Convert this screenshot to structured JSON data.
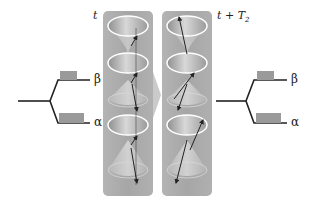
{
  "diagram": {
    "labels": {
      "time_start": "t",
      "time_end_main": "t + T",
      "time_end_sub": "2"
    },
    "energy_levels": {
      "left": {
        "upper": "β",
        "lower": "α"
      },
      "right": {
        "upper": "β",
        "lower": "α"
      }
    },
    "panels": [
      {
        "id": "panel-t",
        "cones": [
          "open-top",
          "open-top",
          "cone-down",
          "open-top",
          "cone-down"
        ]
      },
      {
        "id": "panel-t-plus-T2",
        "cones": [
          "open-top",
          "open-top",
          "cone-down",
          "open-top",
          "cone-down"
        ]
      }
    ],
    "colors": {
      "panel": "#a8a8a8",
      "rim": "#ffffff",
      "line": "#222222",
      "population_box": "#9a9a9a"
    }
  }
}
